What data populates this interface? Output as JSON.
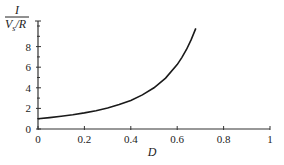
{
  "chart_data": {
    "type": "line",
    "title": "",
    "xlabel": "D",
    "ylabel_num": "I",
    "ylabel_den_v": "V",
    "ylabel_den_sub": "s",
    "ylabel_den_rest": "/R",
    "xlim": [
      0,
      1
    ],
    "ylim": [
      0,
      10
    ],
    "x_ticks": [
      0,
      0.2,
      0.4,
      0.6,
      0.8,
      1
    ],
    "x_tick_labels": [
      "0",
      "0.2",
      "0.4",
      "0.6",
      "0.8",
      "1"
    ],
    "y_ticks": [
      0,
      2,
      4,
      6,
      8
    ],
    "y_tick_labels": [
      "0",
      "2",
      "4",
      "6",
      "8"
    ],
    "y_minor_ticks": [
      1,
      3,
      5,
      7,
      9,
      10
    ],
    "grid": false,
    "series": [
      {
        "name": "I/(Vs/R)",
        "x": [
          0,
          0.05,
          0.1,
          0.15,
          0.2,
          0.25,
          0.3,
          0.35,
          0.4,
          0.45,
          0.5,
          0.55,
          0.6,
          0.62,
          0.64,
          0.66,
          0.68
        ],
        "y": [
          1.0,
          1.11,
          1.23,
          1.38,
          1.56,
          1.78,
          2.04,
          2.37,
          2.78,
          3.31,
          4.0,
          4.94,
          6.25,
          6.93,
          7.72,
          8.65,
          9.77
        ]
      }
    ]
  }
}
